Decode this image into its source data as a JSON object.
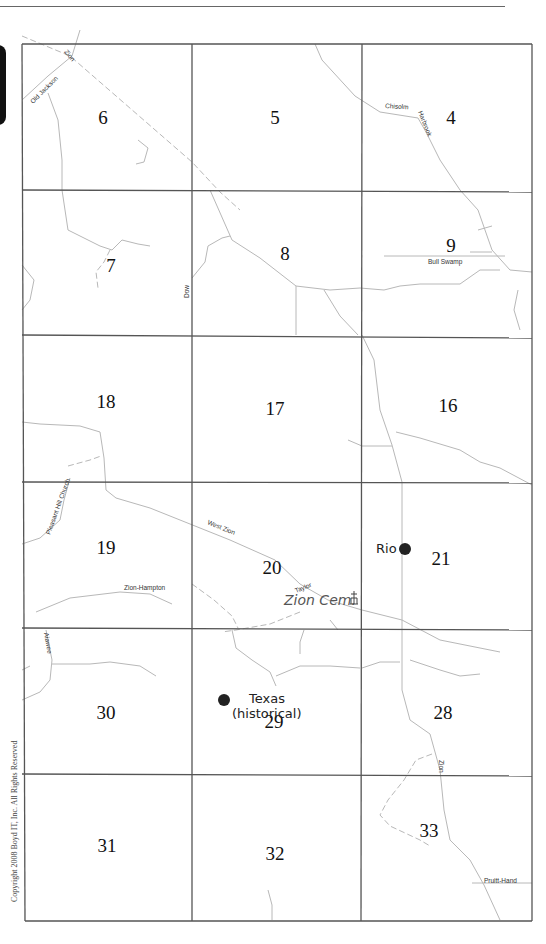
{
  "header": {
    "text_fragment": "y, ... pp"
  },
  "map": {
    "grid": {
      "columns_x": [
        22,
        192,
        362,
        532
      ],
      "rows_y": [
        44,
        190,
        335,
        482,
        628,
        774,
        921
      ]
    },
    "sections": [
      {
        "num": "6",
        "x": 103,
        "y": 124
      },
      {
        "num": "5",
        "x": 275,
        "y": 124
      },
      {
        "num": "4",
        "x": 451,
        "y": 124
      },
      {
        "num": "7",
        "x": 111,
        "y": 272
      },
      {
        "num": "8",
        "x": 285,
        "y": 260
      },
      {
        "num": "9",
        "x": 451,
        "y": 252
      },
      {
        "num": "18",
        "x": 106,
        "y": 408
      },
      {
        "num": "17",
        "x": 275,
        "y": 415
      },
      {
        "num": "16",
        "x": 448,
        "y": 412
      },
      {
        "num": "19",
        "x": 106,
        "y": 554
      },
      {
        "num": "20",
        "x": 272,
        "y": 574
      },
      {
        "num": "21",
        "x": 441,
        "y": 565
      },
      {
        "num": "30",
        "x": 106,
        "y": 719
      },
      {
        "num": "29",
        "x": 274,
        "y": 728
      },
      {
        "num": "28",
        "x": 443,
        "y": 719
      },
      {
        "num": "31",
        "x": 107,
        "y": 852
      },
      {
        "num": "32",
        "x": 275,
        "y": 860
      },
      {
        "num": "33",
        "x": 429,
        "y": 837
      }
    ],
    "road_labels": [
      {
        "text": "Zion",
        "x": 64,
        "y": 52,
        "rotate": 50
      },
      {
        "text": "Old Jackson",
        "x": 33,
        "y": 104,
        "rotate": -45
      },
      {
        "text": "Chisolm",
        "x": 385,
        "y": 108,
        "rotate": 3
      },
      {
        "text": "Harbrook",
        "x": 418,
        "y": 112,
        "rotate": 68
      },
      {
        "text": "Bull Swamp",
        "x": 428,
        "y": 264,
        "rotate": 0
      },
      {
        "text": "Dow",
        "x": 189,
        "y": 298,
        "rotate": -90
      },
      {
        "text": "Pleasant Hill Church",
        "x": 50,
        "y": 535,
        "rotate": -70
      },
      {
        "text": "West Zion",
        "x": 207,
        "y": 524,
        "rotate": 22
      },
      {
        "text": "Zion-Hampton",
        "x": 124,
        "y": 590,
        "rotate": 0
      },
      {
        "text": "Taylor",
        "x": 296,
        "y": 593,
        "rotate": -22
      },
      {
        "text": "Aiawee",
        "x": 44,
        "y": 633,
        "rotate": 80
      },
      {
        "text": "Zion",
        "x": 439,
        "y": 760,
        "rotate": 90
      },
      {
        "text": "Pruitt-Hand",
        "x": 484,
        "y": 883,
        "rotate": 0
      }
    ],
    "places": [
      {
        "name": "Rio",
        "label_x": 376,
        "label_y": 553,
        "dot_x": 405,
        "dot_y": 549
      },
      {
        "name": "Texas",
        "name_line2": "(historical)",
        "label_x": 249,
        "label_y": 703,
        "label2_x": 232,
        "label2_y": 718,
        "dot_x": 224,
        "dot_y": 700
      }
    ],
    "cemetery": {
      "name": "Zion Cem.",
      "x": 284,
      "y": 605,
      "icon_x": 354,
      "icon_y": 598
    },
    "copyright": "Copyright 2008 Boyd IT, Inc. All Rights Reserved"
  }
}
